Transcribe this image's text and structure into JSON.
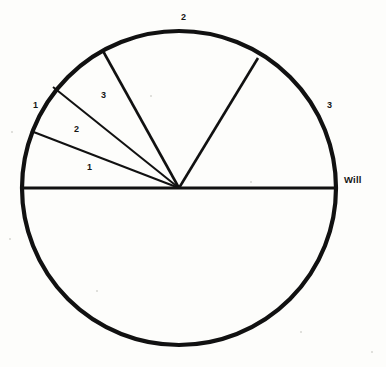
{
  "figure": {
    "kind": "sector-circle-diagram",
    "background_color": "#fdfdfb",
    "ink_color": "#111111",
    "circle": {
      "center_x": 179,
      "center_y": 188,
      "radius": 157,
      "outline_width": 4.2
    },
    "horizontal_diameter": {
      "name": "horizontal-diameter",
      "from_x": 22,
      "to_x": 336,
      "y": 188,
      "width": 3.2
    },
    "spokes": [
      {
        "name": "spoke-to-lower-left",
        "end_x": 31,
        "end_y": 131,
        "width": 2.0
      },
      {
        "name": "spoke-to-upper-left",
        "end_x": 53,
        "end_y": 87,
        "width": 2.0
      },
      {
        "name": "spoke-to-top-left",
        "end_x": 103,
        "end_y": 51,
        "width": 2.6
      },
      {
        "name": "spoke-to-top-right",
        "end_x": 258,
        "end_y": 58,
        "width": 2.6
      }
    ],
    "labels": [
      {
        "name": "label-sector-1-outer-left",
        "text": "1",
        "x": 33,
        "y": 101,
        "class": "lbl-num"
      },
      {
        "name": "label-sector-2-left",
        "text": "2",
        "x": 74,
        "y": 125,
        "class": "lbl-num"
      },
      {
        "name": "label-sector-1-lower-left",
        "text": "1",
        "x": 87,
        "y": 163,
        "class": "lbl-num"
      },
      {
        "name": "label-sector-3-upper-left",
        "text": "3",
        "x": 101,
        "y": 91,
        "class": "lbl-num"
      },
      {
        "name": "label-sector-2-top",
        "text": "2",
        "x": 181,
        "y": 13,
        "class": "lbl-num"
      },
      {
        "name": "label-sector-3-right",
        "text": "3",
        "x": 327,
        "y": 101,
        "class": "lbl-num"
      },
      {
        "name": "label-will",
        "text": "Will",
        "x": 344,
        "y": 175,
        "class": "lbl-word"
      }
    ],
    "specks": [
      {
        "x": 11,
        "y": 131,
        "size": 2
      },
      {
        "x": 9,
        "y": 238,
        "size": 2
      },
      {
        "x": 250,
        "y": 181,
        "size": 2
      },
      {
        "x": 150,
        "y": 95,
        "size": 2
      },
      {
        "x": 371,
        "y": 351,
        "size": 2
      },
      {
        "x": 300,
        "y": 331,
        "size": 2
      },
      {
        "x": 96,
        "y": 290,
        "size": 2
      }
    ]
  }
}
